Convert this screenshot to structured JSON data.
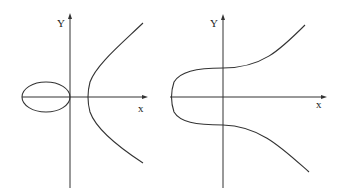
{
  "figure": {
    "panels": [
      {
        "name": "elliptic-curve-two-components",
        "y_axis_label": "Y",
        "x_axis_label": "x",
        "description": "Curve with an oval (egg) component left of origin and an unbounded hyperbola-like branch right of origin"
      },
      {
        "name": "elliptic-curve-one-component",
        "y_axis_label": "Y",
        "x_axis_label": "x",
        "description": "Single connected curve crossing the x-axis once at negative x, with branches extending to upper and lower right"
      }
    ],
    "colors": {
      "line": "#333333",
      "background": "#ffffff"
    }
  }
}
